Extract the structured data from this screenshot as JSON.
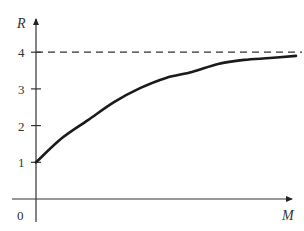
{
  "chart_data": {
    "type": "line",
    "title": "",
    "xlabel": "M",
    "ylabel": "R",
    "origin_label": "0",
    "yticks": [
      1,
      2,
      3,
      4
    ],
    "ytick_labels": [
      "1",
      "2",
      "3",
      "4"
    ],
    "xticks": [],
    "ylim": [
      0,
      4.9
    ],
    "xlim": [
      0,
      10
    ],
    "grid": false,
    "legend": null,
    "asymptote": {
      "y": 4,
      "style": "dashed"
    },
    "series": [
      {
        "name": "R(M)",
        "x": [
          0,
          1,
          2,
          3,
          4,
          5,
          6,
          7,
          8,
          9,
          10
        ],
        "values": [
          1.0,
          1.66,
          2.15,
          2.64,
          3.02,
          3.3,
          3.46,
          3.68,
          3.79,
          3.84,
          3.9
        ]
      }
    ]
  }
}
